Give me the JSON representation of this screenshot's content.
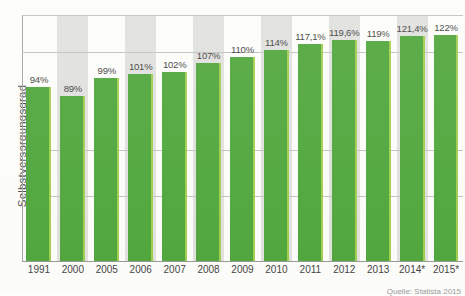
{
  "chart_data": {
    "type": "bar",
    "title": "",
    "xlabel": "",
    "ylabel": "Selbstversorgungsgrad",
    "categories": [
      "1991",
      "2000",
      "2005",
      "2006",
      "2007",
      "2008",
      "2009",
      "2010",
      "2011",
      "2012",
      "2013",
      "2014*",
      "2015*"
    ],
    "values": [
      94,
      89,
      99,
      101,
      102,
      107,
      110,
      114,
      117.1,
      119.6,
      119,
      121.4,
      122
    ],
    "value_labels": [
      "94%",
      "89%",
      "99%",
      "101%",
      "102%",
      "107%",
      "110%",
      "114%",
      "117,1%",
      "119,6%",
      "119%",
      "121,4%",
      "122%"
    ],
    "ylim": [
      0,
      135
    ],
    "grid": true,
    "gridlines_visible": 4,
    "y_tick_labels": [],
    "legend": "none",
    "bar_color": "#3d9e28",
    "bar_edge_color": "#97c93d",
    "band_color": "#dcdcda",
    "banded_categories": [
      "2000",
      "2006",
      "2008",
      "2010",
      "2012",
      "2014*"
    ]
  },
  "footer": {
    "source": "Quelle: Statista 2015"
  }
}
